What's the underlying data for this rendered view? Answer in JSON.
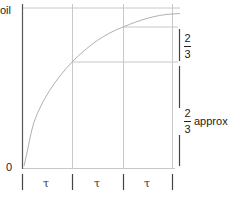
{
  "diagram": {
    "type": "exponential-approach time-constant diagram",
    "y_axis_label": "oil",
    "origin_label": "0",
    "time_constant_symbol": "τ",
    "intervals": [
      {
        "label": "τ"
      },
      {
        "label": "τ"
      },
      {
        "label": "τ"
      }
    ],
    "annotations": {
      "upper_fraction": {
        "numerator": "2",
        "denominator": "3"
      },
      "lower_fraction": {
        "numerator": "2",
        "denominator": "3"
      },
      "lower_suffix": "approx."
    },
    "colors": {
      "axis": "#555555",
      "grid": "#c8c8c8",
      "curve": "#b0b0b0",
      "text": "#222222"
    }
  }
}
